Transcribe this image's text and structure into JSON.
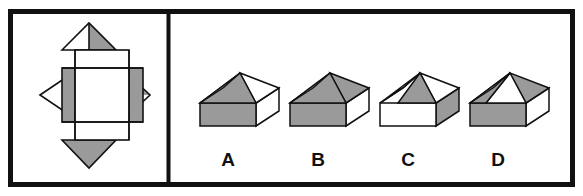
{
  "figure": {
    "type": "spatial-reasoning-multiple-choice",
    "colors": {
      "ink": "#111111",
      "shade": "#9a9a9a",
      "blank": "#ffffff",
      "page": "#ffffff",
      "border": "#111111"
    },
    "frame": {
      "outer_border_px": 5,
      "divider_x": 168,
      "label": "outer-frame"
    },
    "left_panel": {
      "name": "net-panel",
      "description": "Unfolded net of a square box with four triangular flaps",
      "faces": [
        {
          "id": "center-square",
          "shape": "square",
          "position": "center",
          "fill": "blank"
        },
        {
          "id": "upper-rectangle",
          "shape": "rectangle",
          "position": "top",
          "fill": "blank"
        },
        {
          "id": "lower-rectangle",
          "shape": "rectangle",
          "position": "bottom",
          "fill": "blank"
        },
        {
          "id": "left-rectangle",
          "shape": "rectangle",
          "position": "left",
          "fill": "shade"
        },
        {
          "id": "right-rectangle",
          "shape": "rectangle",
          "position": "right",
          "fill": "shade"
        },
        {
          "id": "top-triangle",
          "shape": "triangle",
          "position": "top",
          "fill": "half",
          "half_fill": "right-half-shaded"
        },
        {
          "id": "bottom-triangle",
          "shape": "triangle",
          "position": "bottom",
          "fill": "shade"
        },
        {
          "id": "left-triangle",
          "shape": "triangle",
          "position": "left",
          "fill": "blank"
        },
        {
          "id": "right-triangle",
          "shape": "triangle",
          "position": "right",
          "fill": "half",
          "half_fill": "top-half-shaded"
        }
      ]
    },
    "right_panel": {
      "name": "options-panel",
      "options": [
        {
          "label": "A",
          "name": "option-a",
          "roof_front": "blank_shaded",
          "faces": {
            "roof_left": "blank",
            "roof_front": "shade",
            "roof_right": "blank",
            "box_front": "shade",
            "box_right": "blank"
          }
        },
        {
          "label": "B",
          "name": "option-b",
          "faces": {
            "roof_left": "blank",
            "roof_front": "shade",
            "roof_right": "shade",
            "box_front": "shade",
            "box_right": "blank"
          }
        },
        {
          "label": "C",
          "name": "option-c",
          "faces": {
            "roof_left": "blank",
            "roof_front": "shade",
            "roof_right": "blank",
            "box_front": "blank",
            "box_right": "shade"
          }
        },
        {
          "label": "D",
          "name": "option-d",
          "faces": {
            "roof_left": "shade",
            "roof_front": "blank",
            "roof_right": "shade",
            "box_front": "shade",
            "box_right": "blank"
          }
        }
      ]
    }
  }
}
